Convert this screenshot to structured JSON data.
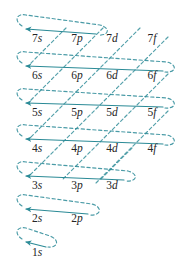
{
  "diagram": {
    "name": "aufbau-filling-order-diagram",
    "accent_color": "#2a8a96",
    "text_color": "#252525",
    "background": "#ffffff",
    "columns": [
      {
        "key": "s",
        "label": "s",
        "x": 37
      },
      {
        "key": "p",
        "label": "p",
        "x": 77
      },
      {
        "key": "d",
        "label": "d",
        "x": 112
      },
      {
        "key": "f",
        "label": "f",
        "x": 152
      }
    ],
    "rows": [
      {
        "n": 7,
        "y": 38
      },
      {
        "n": 6,
        "y": 75
      },
      {
        "n": 5,
        "y": 112
      },
      {
        "n": 4,
        "y": 148
      },
      {
        "n": 3,
        "y": 185
      },
      {
        "n": 2,
        "y": 218
      },
      {
        "n": 1,
        "y": 252
      }
    ],
    "orbitals": [
      {
        "label": "7s",
        "n": "7",
        "l": "s",
        "x": 37,
        "y": 38
      },
      {
        "label": "7p",
        "n": "7",
        "l": "p",
        "x": 77,
        "y": 38
      },
      {
        "label": "7d",
        "n": "7",
        "l": "d",
        "x": 112,
        "y": 38
      },
      {
        "label": "7f",
        "n": "7",
        "l": "f",
        "x": 152,
        "y": 38
      },
      {
        "label": "6s",
        "n": "6",
        "l": "s",
        "x": 37,
        "y": 75
      },
      {
        "label": "6p",
        "n": "6",
        "l": "p",
        "x": 77,
        "y": 75
      },
      {
        "label": "6d",
        "n": "6",
        "l": "d",
        "x": 112,
        "y": 75
      },
      {
        "label": "6f",
        "n": "6",
        "l": "f",
        "x": 152,
        "y": 75
      },
      {
        "label": "5s",
        "n": "5",
        "l": "s",
        "x": 37,
        "y": 112
      },
      {
        "label": "5p",
        "n": "5",
        "l": "p",
        "x": 77,
        "y": 112
      },
      {
        "label": "5d",
        "n": "5",
        "l": "d",
        "x": 112,
        "y": 112
      },
      {
        "label": "5f",
        "n": "5",
        "l": "f",
        "x": 152,
        "y": 112
      },
      {
        "label": "4s",
        "n": "4",
        "l": "s",
        "x": 37,
        "y": 148
      },
      {
        "label": "4p",
        "n": "4",
        "l": "p",
        "x": 77,
        "y": 148
      },
      {
        "label": "4d",
        "n": "4",
        "l": "d",
        "x": 112,
        "y": 148
      },
      {
        "label": "4f",
        "n": "4",
        "l": "f",
        "x": 152,
        "y": 148
      },
      {
        "label": "3s",
        "n": "3",
        "l": "s",
        "x": 37,
        "y": 185
      },
      {
        "label": "3p",
        "n": "3",
        "l": "p",
        "x": 77,
        "y": 185
      },
      {
        "label": "3d",
        "n": "3",
        "l": "d",
        "x": 112,
        "y": 185
      },
      {
        "label": "2s",
        "n": "2",
        "l": "s",
        "x": 37,
        "y": 218
      },
      {
        "label": "2p",
        "n": "2",
        "l": "p",
        "x": 77,
        "y": 218
      },
      {
        "label": "1s",
        "n": "1",
        "l": "s",
        "x": 37,
        "y": 252
      }
    ],
    "diagonals": [
      {
        "name": "diagonal-1s",
        "orbitals": [
          "1s"
        ],
        "start": [
          46,
          246
        ],
        "end": [
          21,
          241
        ]
      },
      {
        "name": "diagonal-2s-2p",
        "orbitals": [
          "2s",
          "2p"
        ],
        "start": [
          86,
          212
        ],
        "end": [
          21,
          207
        ]
      },
      {
        "name": "diagonal-3s-3p-3d",
        "orbitals": [
          "3s",
          "3p",
          "3d"
        ],
        "start": [
          122,
          179
        ],
        "end": [
          21,
          174
        ]
      },
      {
        "name": "diagonal-4s-4p-4d-4f",
        "orbitals": [
          "4s",
          "4p",
          "4d",
          "4f"
        ],
        "start": [
          161,
          142
        ],
        "end": [
          21,
          137
        ]
      },
      {
        "name": "diagonal-5s-5p-5d-5f",
        "orbitals": [
          "5s",
          "5p",
          "5d",
          "5f"
        ],
        "start": [
          161,
          106
        ],
        "end": [
          21,
          101
        ]
      },
      {
        "name": "diagonal-6s-6p-6d-6f",
        "orbitals": [
          "6s",
          "6p",
          "6d",
          "6f"
        ],
        "start": [
          161,
          69
        ],
        "end": [
          21,
          64
        ]
      },
      {
        "name": "diagonal-7s-7p",
        "orbitals": [
          "7s",
          "7p"
        ],
        "start": [
          94,
          32
        ],
        "end": [
          21,
          27
        ]
      }
    ]
  }
}
